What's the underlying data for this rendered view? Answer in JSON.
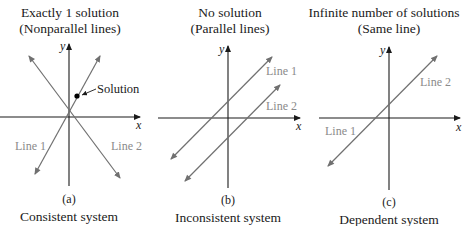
{
  "panels": [
    {
      "id": "a",
      "title_line1": "Exactly 1 solution",
      "title_line2": "(Nonparallel lines)",
      "sublabel": "(a)",
      "caption": "Consistent system",
      "line1_label": "Line 1",
      "line2_label": "Line 2",
      "point_label": "Solution",
      "x_axis_label": "x",
      "y_axis_label": "y"
    },
    {
      "id": "b",
      "title_line1": "No solution",
      "title_line2": "(Parallel lines)",
      "sublabel": "(b)",
      "caption": "Inconsistent system",
      "line1_label": "Line 1",
      "line2_label": "Line 2",
      "x_axis_label": "x",
      "y_axis_label": "y"
    },
    {
      "id": "c",
      "title_line1": "Infinite number of solutions",
      "title_line2": "(Same line)",
      "sublabel": "(c)",
      "caption": "Dependent system",
      "line1_label": "Line 1",
      "line2_label": "Line 2",
      "x_axis_label": "x",
      "y_axis_label": "y"
    }
  ],
  "colors": {
    "axis": "#1a1a1a",
    "line": "#707070",
    "line_label": "#8a8a8a",
    "point": "#000000"
  }
}
